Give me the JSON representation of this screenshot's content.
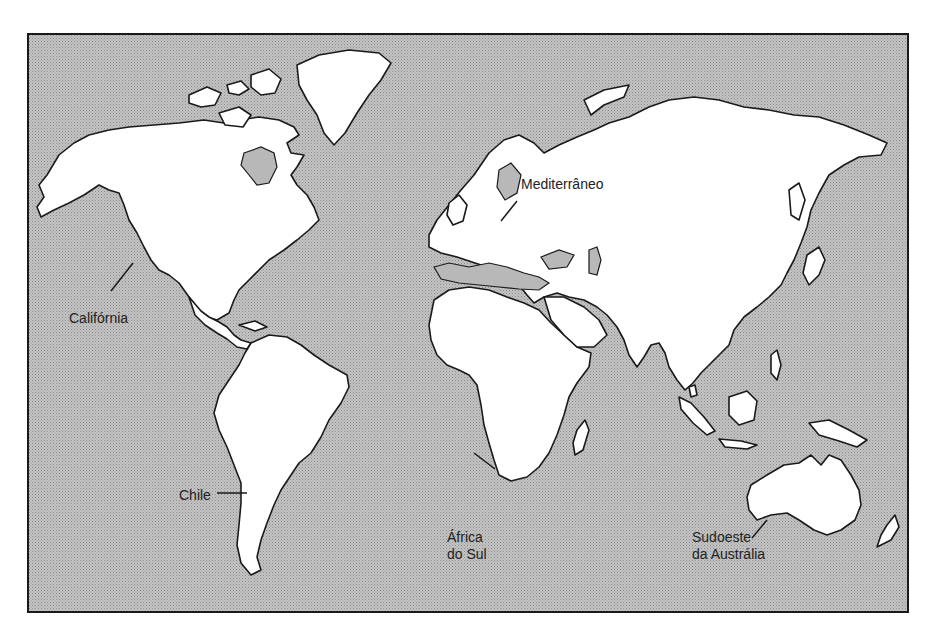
{
  "map": {
    "type": "world-outline-map",
    "colors": {
      "ocean": "#b8b8b8",
      "land": "#ffffff",
      "outline": "#1a1a1a",
      "border": "#1a1a1a"
    },
    "labels": [
      {
        "id": "mediterraneo",
        "text": "Mediterrâneo",
        "lines": [
          "Mediterrâneo"
        ]
      },
      {
        "id": "california",
        "text": "Califórnia",
        "lines": [
          "Califórnia"
        ]
      },
      {
        "id": "chile",
        "text": "Chile",
        "lines": [
          "Chile"
        ]
      },
      {
        "id": "africa-do-sul",
        "text": "África do Sul",
        "lines": [
          "África",
          "do Sul"
        ]
      },
      {
        "id": "sudoeste-australia",
        "text": "Sudoeste da Austrália",
        "lines": [
          "Sudoeste",
          "da Austrália"
        ]
      }
    ]
  }
}
